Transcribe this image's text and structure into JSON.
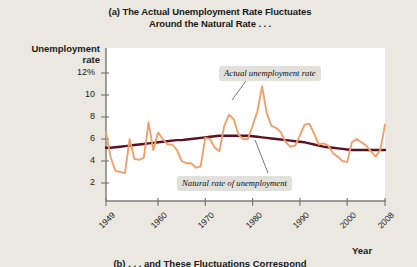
{
  "figure": {
    "panel_label": "(a)",
    "title_line1": "(a) The Actual Unemployment Rate Fluctuates",
    "title_line2": "Around the Natural Rate . . .",
    "bottom_caption": "(b) . . . and These Fluctuations Correspond",
    "background_color": "#ebe8e1",
    "plot_background_color": "#ffffff"
  },
  "axes": {
    "ylabel_line1": "Unemployment",
    "ylabel_line2": "rate",
    "xlabel": "Year",
    "ytick_labels": [
      "12%",
      "10",
      "8",
      "6",
      "4",
      "2"
    ],
    "xtick_labels": [
      "1949",
      "1960",
      "1970",
      "1980",
      "1990",
      "2000",
      "2008"
    ]
  },
  "annotations": [
    {
      "id": "actual",
      "text": "Actual unemployment rate"
    },
    {
      "id": "natural",
      "text": "Natural rate of unemployment"
    }
  ],
  "colors": {
    "actual_line": "#f0a06a",
    "natural_line": "#5c1123",
    "axis": "#7a7a74",
    "annotation_bg": "#e2e0da",
    "text": "#1a1a1a"
  },
  "chart_data": {
    "type": "line",
    "title": "(a) The Actual Unemployment Rate Fluctuates Around the Natural Rate . . .",
    "xlabel": "Year",
    "ylabel": "Unemployment rate",
    "xlim": [
      1949,
      2008
    ],
    "ylim": [
      0,
      13
    ],
    "yticks": [
      2,
      4,
      6,
      8,
      10,
      12
    ],
    "xticks": [
      1949,
      1960,
      1970,
      1980,
      1990,
      2000,
      2008
    ],
    "grid": false,
    "legend": "annotations-inline",
    "x": [
      1949,
      1950,
      1951,
      1952,
      1953,
      1954,
      1955,
      1956,
      1957,
      1958,
      1959,
      1960,
      1961,
      1962,
      1963,
      1964,
      1965,
      1966,
      1967,
      1968,
      1969,
      1970,
      1971,
      1972,
      1973,
      1974,
      1975,
      1976,
      1977,
      1978,
      1979,
      1980,
      1981,
      1982,
      1983,
      1984,
      1985,
      1986,
      1987,
      1988,
      1989,
      1990,
      1991,
      1992,
      1993,
      1994,
      1995,
      1996,
      1997,
      1998,
      1999,
      2000,
      2001,
      2002,
      2003,
      2004,
      2005,
      2006,
      2007,
      2008
    ],
    "series": [
      {
        "name": "Actual unemployment rate",
        "color": "#f0a06a",
        "values": [
          6.6,
          4.3,
          3.1,
          3.0,
          2.9,
          6.0,
          4.2,
          4.1,
          4.3,
          7.5,
          5.0,
          6.6,
          6.0,
          5.5,
          5.5,
          5.0,
          4.0,
          3.8,
          3.8,
          3.4,
          3.5,
          6.1,
          6.0,
          5.2,
          4.9,
          7.2,
          8.2,
          7.8,
          6.4,
          6.0,
          6.0,
          7.2,
          8.5,
          10.8,
          8.3,
          7.2,
          7.0,
          6.6,
          5.7,
          5.3,
          5.4,
          6.3,
          7.3,
          7.4,
          6.5,
          5.5,
          5.6,
          5.4,
          4.7,
          4.4,
          4.0,
          3.9,
          5.7,
          6.0,
          5.7,
          5.4,
          4.9,
          4.4,
          5.0,
          7.3
        ]
      },
      {
        "name": "Natural rate of unemployment",
        "color": "#5c1123",
        "values": [
          5.2,
          5.2,
          5.25,
          5.3,
          5.35,
          5.4,
          5.45,
          5.5,
          5.55,
          5.6,
          5.65,
          5.7,
          5.75,
          5.8,
          5.85,
          5.9,
          5.9,
          5.95,
          6.0,
          6.05,
          6.1,
          6.15,
          6.2,
          6.25,
          6.3,
          6.3,
          6.3,
          6.3,
          6.3,
          6.3,
          6.3,
          6.25,
          6.2,
          6.15,
          6.1,
          6.05,
          6.0,
          5.95,
          5.9,
          5.85,
          5.8,
          5.75,
          5.7,
          5.6,
          5.5,
          5.4,
          5.3,
          5.25,
          5.2,
          5.15,
          5.1,
          5.05,
          5.0,
          5.0,
          5.0,
          5.0,
          5.0,
          5.0,
          5.0,
          5.0
        ]
      }
    ]
  }
}
